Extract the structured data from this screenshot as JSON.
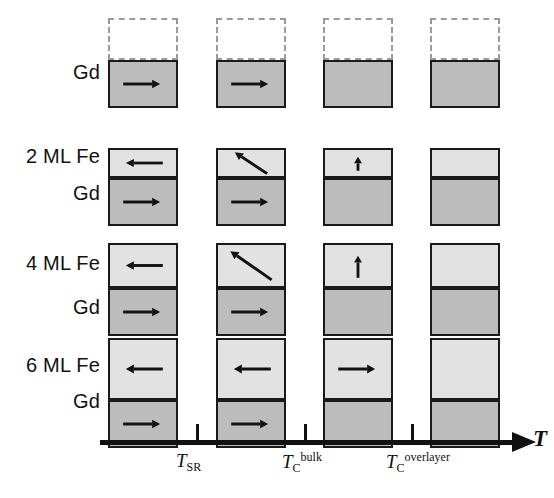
{
  "figure": {
    "colors": {
      "fe_layer": "#e2e2e2",
      "gd_layer": "#bcbcbc",
      "outline": "#1a1a1a",
      "empty_layer_border": "#9a9a9a",
      "background": "#ffffff"
    }
  },
  "axis": {
    "title": "T",
    "ticks": [
      {
        "id": "tsr",
        "base": "T",
        "sub": "SR",
        "sup": ""
      },
      {
        "id": "tc_bulk",
        "base": "T",
        "sub": "C",
        "sup": "bulk"
      },
      {
        "id": "tc_overlayer",
        "base": "T",
        "sub": "C",
        "sup": "overlayer"
      }
    ]
  },
  "rows": [
    {
      "id": "row-gd",
      "top_label": "",
      "bottom_label": "Gd",
      "fe_thickness_ml": 0,
      "cells": [
        {
          "fe": "none",
          "gd": "right"
        },
        {
          "fe": "none",
          "gd": "right"
        },
        {
          "fe": "none",
          "gd": "none"
        },
        {
          "fe": "none",
          "gd": "none"
        }
      ]
    },
    {
      "id": "row-2ml",
      "top_label": "2 ML Fe",
      "bottom_label": "Gd",
      "fe_thickness_ml": 2,
      "cells": [
        {
          "fe": "left",
          "gd": "right"
        },
        {
          "fe": "diag-upleft",
          "gd": "right"
        },
        {
          "fe": "up",
          "gd": "none"
        },
        {
          "fe": "none",
          "gd": "none"
        }
      ]
    },
    {
      "id": "row-4ml",
      "top_label": "4 ML Fe",
      "bottom_label": "Gd",
      "fe_thickness_ml": 4,
      "cells": [
        {
          "fe": "left",
          "gd": "right"
        },
        {
          "fe": "diag-upleft",
          "gd": "right"
        },
        {
          "fe": "up",
          "gd": "none"
        },
        {
          "fe": "none",
          "gd": "none"
        }
      ]
    },
    {
      "id": "row-6ml",
      "top_label": "6 ML Fe",
      "bottom_label": "Gd",
      "fe_thickness_ml": 6,
      "cells": [
        {
          "fe": "left",
          "gd": "right"
        },
        {
          "fe": "left",
          "gd": "right"
        },
        {
          "fe": "right",
          "gd": "none"
        },
        {
          "fe": "none",
          "gd": "none"
        }
      ]
    }
  ]
}
